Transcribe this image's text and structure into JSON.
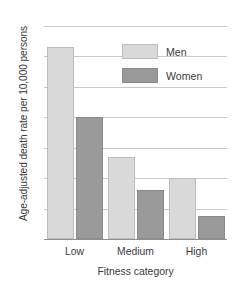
{
  "chart_data": {
    "type": "bar",
    "title": "",
    "subtitle": "",
    "xlabel": "Fitness category",
    "ylabel": "Age-adjusted death rate per 10,000 persons",
    "categories": [
      "Low",
      "Medium",
      "High"
    ],
    "series": [
      {
        "name": "Men",
        "values": [
          63,
          27,
          20
        ],
        "color": "#d9d9d9"
      },
      {
        "name": "Women",
        "values": [
          40,
          16,
          7.5
        ],
        "color": "#9a9a9a"
      }
    ],
    "ylim": [
      0,
      70
    ],
    "ytick_values": [
      0,
      10,
      20,
      30,
      40,
      50,
      60,
      70
    ],
    "ytick_labels": [
      "0",
      "10",
      "20",
      "30",
      "40",
      "50",
      "60",
      "70"
    ],
    "grid": true,
    "grid_axis": "y",
    "legend_position": "top-right",
    "legend_entries": [
      "Men",
      "Women"
    ],
    "annotations": []
  },
  "axis": {
    "y_title": "Age-adjusted death rate per 10,000 persons",
    "x_title": "Fitness category",
    "ticks": [
      "0",
      "10",
      "20",
      "30",
      "40",
      "50",
      "60",
      "70"
    ]
  },
  "legend": {
    "items": [
      {
        "label": "Men"
      },
      {
        "label": "Women"
      }
    ]
  },
  "categories": [
    {
      "label": "Low"
    },
    {
      "label": "Medium"
    },
    {
      "label": "High"
    }
  ]
}
